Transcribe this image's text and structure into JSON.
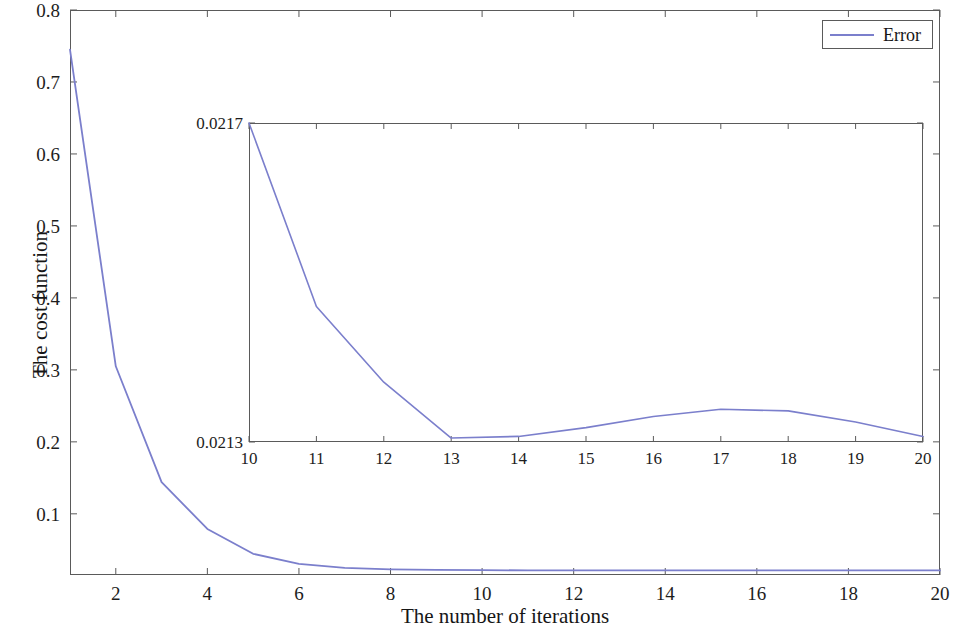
{
  "figure": {
    "width": 964,
    "height": 634,
    "background": "#ffffff",
    "line_color": "#7b7fcc",
    "axis_color": "#5a5a5a"
  },
  "legend": {
    "entries": [
      {
        "label": "Error",
        "color": "#7b7fcc"
      }
    ]
  },
  "chart_data": {
    "type": "line",
    "title": "",
    "xlabel": "The number of iterations",
    "ylabel": "The cost function",
    "xlim": [
      1,
      20
    ],
    "ylim": [
      0.015,
      0.8
    ],
    "xticks": [
      2,
      4,
      6,
      8,
      10,
      12,
      14,
      16,
      18,
      20
    ],
    "xtick_labels": [
      "2",
      "4",
      "6",
      "8",
      "10",
      "12",
      "14",
      "16",
      "18",
      "20"
    ],
    "yticks": [
      0.1,
      0.2,
      0.3,
      0.4,
      0.5,
      0.6,
      0.7,
      0.8
    ],
    "ytick_labels": [
      "0.1",
      "0.2",
      "0.3",
      "0.4",
      "0.5",
      "0.6",
      "0.7",
      "0.8"
    ],
    "grid": false,
    "legend_position": "upper right",
    "series": [
      {
        "name": "Error",
        "color": "#7b7fcc",
        "x": [
          1,
          2,
          3,
          4,
          5,
          6,
          7,
          8,
          9,
          10,
          11,
          12,
          13,
          14,
          15,
          16,
          17,
          18,
          19,
          20
        ],
        "values": [
          0.745,
          0.305,
          0.144,
          0.079,
          0.0445,
          0.0305,
          0.0248,
          0.0228,
          0.0221,
          0.0217,
          0.02147,
          0.021375,
          0.021305,
          0.021307,
          0.021318,
          0.021332,
          0.021341,
          0.021339,
          0.021325,
          0.021307
        ]
      }
    ],
    "inset": {
      "type": "line",
      "xlim": [
        10,
        20
      ],
      "ylim": [
        0.0213,
        0.0217
      ],
      "xticks": [
        10,
        11,
        12,
        13,
        14,
        15,
        16,
        17,
        18,
        19,
        20
      ],
      "xtick_labels": [
        "10",
        "11",
        "12",
        "13",
        "14",
        "15",
        "16",
        "17",
        "18",
        "19",
        "20"
      ],
      "yticks": [
        0.0213,
        0.0217
      ],
      "ytick_labels": [
        "0.0213",
        "0.0217"
      ],
      "grid": false,
      "series": [
        {
          "name": "Error",
          "color": "#7b7fcc",
          "x": [
            10,
            11,
            12,
            13,
            14,
            15,
            16,
            17,
            18,
            19,
            20
          ],
          "values": [
            0.0217,
            0.02147,
            0.021375,
            0.021305,
            0.021307,
            0.021318,
            0.021332,
            0.021341,
            0.021339,
            0.021325,
            0.021307
          ]
        }
      ]
    }
  }
}
